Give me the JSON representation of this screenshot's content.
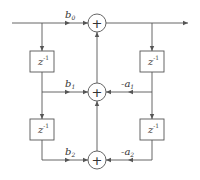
{
  "diagram": {
    "type": "biquad-direct-form-II-transposed",
    "colors": {
      "line": "#555555",
      "background": "#ffffff",
      "text": "#333333"
    },
    "adders": [
      {
        "id": "adder-top",
        "symbol": "+"
      },
      {
        "id": "adder-mid",
        "symbol": "+"
      },
      {
        "id": "adder-bottom",
        "symbol": "+"
      }
    ],
    "delays": [
      {
        "id": "delay-left-1",
        "label": "z",
        "exp": "-1"
      },
      {
        "id": "delay-left-2",
        "label": "z",
        "exp": "-1"
      },
      {
        "id": "delay-right-1",
        "label": "z",
        "exp": "-1"
      },
      {
        "id": "delay-right-2",
        "label": "z",
        "exp": "-1"
      }
    ],
    "coefficients": {
      "b0": {
        "base": "b",
        "sub": "0"
      },
      "b1": {
        "base": "b",
        "sub": "1"
      },
      "b2": {
        "base": "b",
        "sub": "2"
      },
      "a1": {
        "base": "-a",
        "sub": "1"
      },
      "a2": {
        "base": "-a",
        "sub": "2"
      }
    }
  }
}
